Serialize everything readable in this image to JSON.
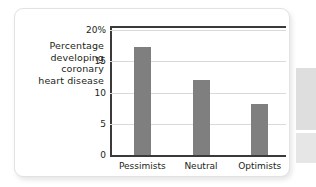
{
  "chart_data": {
    "type": "bar",
    "title": "",
    "subtitle": "",
    "xlabel": "",
    "ylabel": "Percentage developing coronary heart disease",
    "ylabel_lines": [
      "Percentage",
      "developing",
      "coronary",
      "heart disease"
    ],
    "categories": [
      "Pessimists",
      "Neutral",
      "Optimists"
    ],
    "values": [
      17.3,
      12.0,
      8.2
    ],
    "series": [
      {
        "name": "Percentage developing coronary heart disease",
        "values": [
          17.3,
          12.0,
          8.2
        ]
      }
    ],
    "ylim": [
      0,
      20
    ],
    "yticks": [
      0,
      5,
      10,
      15,
      20
    ],
    "ytick_labels": [
      "0",
      "5",
      "10",
      "15",
      "20%"
    ],
    "grid": true,
    "grid_axis": "y",
    "legend": false,
    "legend_position": "none",
    "bar_color": "#7f7f7f",
    "grid_color": "#d9d9d9",
    "axis_color": "#3a3a3a",
    "text_color": "#231f20",
    "background": "#ffffff"
  },
  "card": {
    "border_color": "#e2e2e2",
    "background": "#ffffff"
  }
}
